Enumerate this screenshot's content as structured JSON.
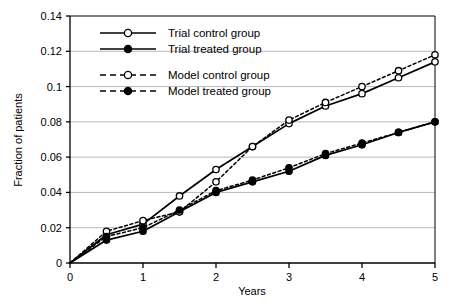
{
  "chart_data": {
    "type": "line",
    "title": "",
    "subtitle": "",
    "xlabel": "Years",
    "ylabel": "Fraction of patients",
    "xlim": [
      0,
      5
    ],
    "ylim": [
      0,
      0.14
    ],
    "xticks": [
      "0",
      "1",
      "2",
      "3",
      "4",
      "5"
    ],
    "xtick_values": [
      0,
      1,
      2,
      3,
      4,
      5
    ],
    "yticks": [
      "0",
      "0.02",
      "0.04",
      "0.06",
      "0.08",
      "0.1",
      "0.12",
      "0.14"
    ],
    "ytick_values": [
      0,
      0.02,
      0.04,
      0.06,
      0.08,
      0.1,
      0.12,
      0.14
    ],
    "grid": "horizontal",
    "legend_position": "upper-left-inside",
    "x": [
      0,
      0.5,
      1,
      1.5,
      2,
      2.5,
      3,
      3.5,
      4,
      4.5,
      5
    ],
    "series": [
      {
        "name": "Trial control group",
        "linestyle": "solid",
        "marker": "open-circle",
        "color": "#000000",
        "values": [
          0,
          0.016,
          0.022,
          0.038,
          0.053,
          0.066,
          0.079,
          0.089,
          0.096,
          0.105,
          0.114
        ]
      },
      {
        "name": "Trial treated group",
        "linestyle": "solid",
        "marker": "filled-circle",
        "color": "#000000",
        "values": [
          0,
          0.013,
          0.018,
          0.029,
          0.04,
          0.046,
          0.052,
          0.061,
          0.067,
          0.074,
          0.08
        ]
      },
      {
        "name": "Model control group",
        "linestyle": "dashed",
        "marker": "open-circle",
        "color": "#000000",
        "values": [
          0,
          0.018,
          0.024,
          0.029,
          0.046,
          0.066,
          0.081,
          0.091,
          0.1,
          0.109,
          0.118
        ]
      },
      {
        "name": "Model treated group",
        "linestyle": "dashed",
        "marker": "filled-circle",
        "color": "#000000",
        "values": [
          0,
          0.015,
          0.02,
          0.03,
          0.041,
          0.047,
          0.054,
          0.062,
          0.068,
          0.074,
          0.08
        ]
      }
    ]
  },
  "legend": {
    "items": [
      {
        "label": "Trial control group",
        "style": "solid",
        "marker": "open-circle"
      },
      {
        "label": "Trial treated group",
        "style": "solid",
        "marker": "filled-circle"
      },
      {
        "label": "Model control group",
        "style": "dashed",
        "marker": "open-circle"
      },
      {
        "label": "Model treated group",
        "style": "dashed",
        "marker": "filled-circle"
      }
    ]
  },
  "colors": {
    "ink": "#000000",
    "grid": "#b9b9b9",
    "axis": "#000000",
    "background": "#ffffff"
  }
}
